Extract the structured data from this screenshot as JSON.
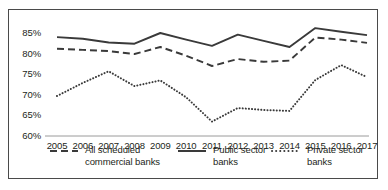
{
  "chart_data": {
    "type": "line",
    "title": "",
    "xlabel": "",
    "ylabel": "",
    "categories": [
      "2005",
      "2006",
      "2007",
      "2008",
      "2009",
      "2010",
      "2011",
      "2012",
      "2013",
      "2014",
      "2015",
      "2016",
      "2017"
    ],
    "ylim": [
      60,
      85
    ],
    "xlim_note": "categorical years 2005-2017",
    "ytick_labels": [
      "85%",
      "80%",
      "75%",
      "70%",
      "65%",
      "60%"
    ],
    "ytick_values": [
      85,
      80,
      75,
      70,
      65,
      60
    ],
    "grid": false,
    "legend_position": "bottom",
    "axis_color": "#8c8c8c",
    "line_color": "#3a3a3a",
    "series": [
      {
        "name": "All scheduled commercial banks",
        "style": "dashed",
        "values": [
          81.2,
          80.9,
          80.6,
          79.9,
          81.6,
          79.5,
          77.0,
          78.7,
          78.0,
          78.3,
          83.9,
          83.4,
          82.6
        ]
      },
      {
        "name": "Public sector banks",
        "style": "solid",
        "values": [
          84.0,
          83.6,
          82.7,
          82.4,
          85.0,
          83.4,
          81.9,
          84.6,
          83.1,
          81.6,
          86.2,
          85.3,
          84.5
        ]
      },
      {
        "name": "Private sector banks",
        "style": "dotted",
        "values": [
          69.7,
          72.9,
          75.7,
          72.1,
          73.5,
          69.4,
          63.5,
          66.8,
          66.3,
          66.1,
          73.6,
          77.2,
          74.3
        ]
      }
    ]
  },
  "legend": {
    "items": [
      {
        "label": "All scheduled\ncommercial banks",
        "style": "dashed"
      },
      {
        "label": "Public sector\nbanks",
        "style": "solid"
      },
      {
        "label": "Private sector\nbanks",
        "style": "dotted"
      }
    ]
  }
}
